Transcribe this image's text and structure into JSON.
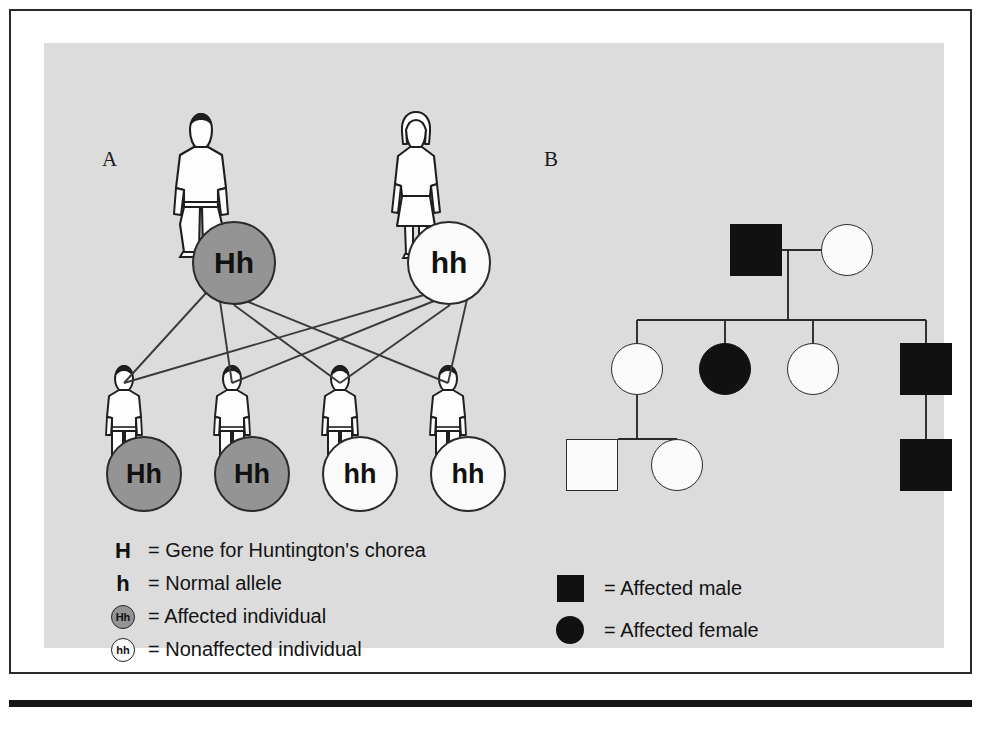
{
  "figure": {
    "panel_a_label": "A",
    "panel_b_label": "B"
  },
  "panel_a": {
    "parents": [
      {
        "genotype": "Hh",
        "status": "affected",
        "sex": "male",
        "x": 148,
        "y": 178
      },
      {
        "genotype": "hh",
        "status": "normal",
        "sex": "female",
        "x": 363,
        "y": 178
      }
    ],
    "children": [
      {
        "genotype": "Hh",
        "status": "affected",
        "x": 62,
        "y": 393
      },
      {
        "genotype": "Hh",
        "status": "affected",
        "x": 170,
        "y": 393
      },
      {
        "genotype": "hh",
        "status": "normal",
        "x": 278,
        "y": 393
      },
      {
        "genotype": "hh",
        "status": "normal",
        "x": 386,
        "y": 393
      }
    ],
    "legend": [
      {
        "key_type": "letter",
        "key": "H",
        "status": "",
        "text": "= Gene for Huntington's chorea"
      },
      {
        "key_type": "letter",
        "key": "h",
        "status": "",
        "text": "= Normal allele"
      },
      {
        "key_type": "circle",
        "key": "Hh",
        "status": "affected",
        "text": "= Affected individual"
      },
      {
        "key_type": "circle",
        "key": "hh",
        "status": "normal",
        "text": "= Nonaffected individual"
      }
    ]
  },
  "panel_b": {
    "generation_1": [
      {
        "shape": "square",
        "fill": "filled",
        "sex": "male",
        "x": 662,
        "y": 178
      },
      {
        "shape": "circle",
        "fill": "open",
        "sex": "female",
        "x": 777,
        "y": 181
      }
    ],
    "generation_2": [
      {
        "shape": "circle",
        "fill": "open",
        "sex": "female",
        "x": 593,
        "y": 300
      },
      {
        "shape": "circle",
        "fill": "filled",
        "sex": "female",
        "x": 681,
        "y": 300
      },
      {
        "shape": "circle",
        "fill": "open",
        "sex": "female",
        "x": 769,
        "y": 300
      },
      {
        "shape": "square",
        "fill": "filled",
        "sex": "male",
        "x": 856,
        "y": 300
      }
    ],
    "generation_3": [
      {
        "shape": "square",
        "fill": "open",
        "sex": "male",
        "x": 548,
        "y": 396
      },
      {
        "shape": "circle",
        "fill": "open",
        "sex": "female",
        "x": 633,
        "y": 396
      },
      {
        "shape": "square",
        "fill": "filled",
        "sex": "male",
        "x": 856,
        "y": 396
      }
    ],
    "legend": [
      {
        "symbol": "square",
        "text": "= Affected male"
      },
      {
        "symbol": "circle",
        "text": "= Affected female"
      }
    ]
  },
  "colors": {
    "affected_fill": "#949494",
    "normal_fill": "#fbfbfb",
    "pedigree_filled": "#111111",
    "panel_background": "#dcdcdc",
    "stroke": "#2a2a2a",
    "frame_border": "#2b2b2b"
  }
}
